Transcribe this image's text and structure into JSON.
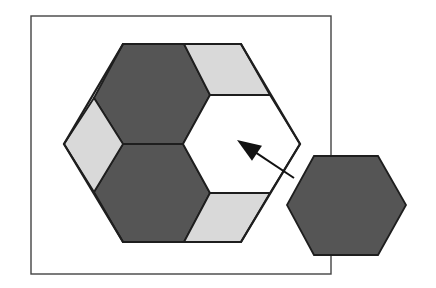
{
  "diagram": {
    "colors": {
      "background": "#ffffff",
      "frame_stroke": "#444444",
      "outline": "#1e1e1e",
      "dark_fill": "#555555",
      "light_fill": "#d9d9d9",
      "empty_fill": "#ffffff",
      "arrow": "#111111"
    },
    "frame": {
      "x": 31,
      "y": 16,
      "width": 300,
      "height": 258
    },
    "big_hexagon": {
      "points": [
        [
          123,
          44
        ],
        [
          241,
          44
        ],
        [
          300,
          144
        ],
        [
          241,
          242
        ],
        [
          123,
          242
        ],
        [
          64,
          144
        ]
      ]
    },
    "pieces": [
      {
        "id": "dark-hex-top",
        "fill": "dark",
        "points": [
          [
            123,
            44
          ],
          [
            184,
            44
          ],
          [
            210,
            95
          ],
          [
            183,
            144
          ],
          [
            123,
            144
          ],
          [
            94,
            98
          ]
        ]
      },
      {
        "id": "dark-hex-bottom",
        "fill": "dark",
        "points": [
          [
            123,
            144
          ],
          [
            183,
            144
          ],
          [
            210,
            193
          ],
          [
            184,
            242
          ],
          [
            123,
            242
          ],
          [
            94,
            192
          ]
        ]
      },
      {
        "id": "light-rhombus-top-right",
        "fill": "light",
        "points": [
          [
            184,
            44
          ],
          [
            241,
            44
          ],
          [
            270,
            95
          ],
          [
            210,
            95
          ]
        ]
      },
      {
        "id": "light-rhombus-left",
        "fill": "light",
        "points": [
          [
            64,
            144
          ],
          [
            94,
            98
          ],
          [
            123,
            144
          ],
          [
            94,
            192
          ]
        ]
      },
      {
        "id": "light-rhombus-bottom-right",
        "fill": "light",
        "points": [
          [
            210,
            193
          ],
          [
            270,
            193
          ],
          [
            241,
            242
          ],
          [
            184,
            242
          ]
        ]
      },
      {
        "id": "empty-hex-slot",
        "fill": "empty",
        "points": [
          [
            210,
            95
          ],
          [
            270,
            95
          ],
          [
            300,
            144
          ],
          [
            270,
            193
          ],
          [
            210,
            193
          ],
          [
            183,
            144
          ]
        ]
      }
    ],
    "loose_piece": {
      "id": "dark-hex-loose",
      "fill": "dark",
      "points": [
        [
          314,
          156
        ],
        [
          378,
          156
        ],
        [
          406,
          205
        ],
        [
          378,
          255
        ],
        [
          314,
          255
        ],
        [
          287,
          205
        ]
      ]
    },
    "arrow": {
      "tail": [
        294,
        178
      ],
      "tip": [
        237,
        140
      ],
      "head_length": 24,
      "head_width": 18
    }
  }
}
